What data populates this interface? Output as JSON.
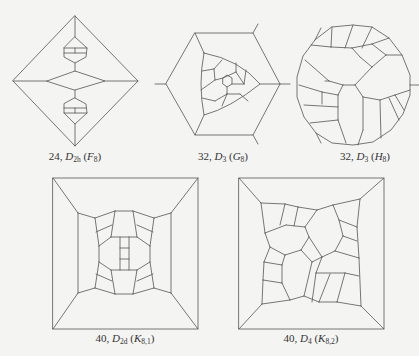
{
  "figures": [
    {
      "id": "F8",
      "vertices": "24",
      "group": "D",
      "group_sub": "2h",
      "name": "F",
      "name_sub": "8"
    },
    {
      "id": "G8",
      "vertices": "32",
      "group": "D",
      "group_sub": "3",
      "name": "G",
      "name_sub": "8"
    },
    {
      "id": "H8",
      "vertices": "32",
      "group": "D",
      "group_sub": "3",
      "name": "H",
      "name_sub": "8"
    },
    {
      "id": "K81",
      "vertices": "40",
      "group": "D",
      "group_sub": "2d",
      "name": "K",
      "name_sub": "8,1"
    },
    {
      "id": "K82",
      "vertices": "40",
      "group": "D",
      "group_sub": "4",
      "name": "K",
      "name_sub": "8,2"
    }
  ],
  "punct": {
    "sep": ", ",
    "open": " (",
    "close": ")"
  },
  "colors": {
    "edge": "#555555",
    "background": "#f4f4f2",
    "text": "#333333"
  }
}
